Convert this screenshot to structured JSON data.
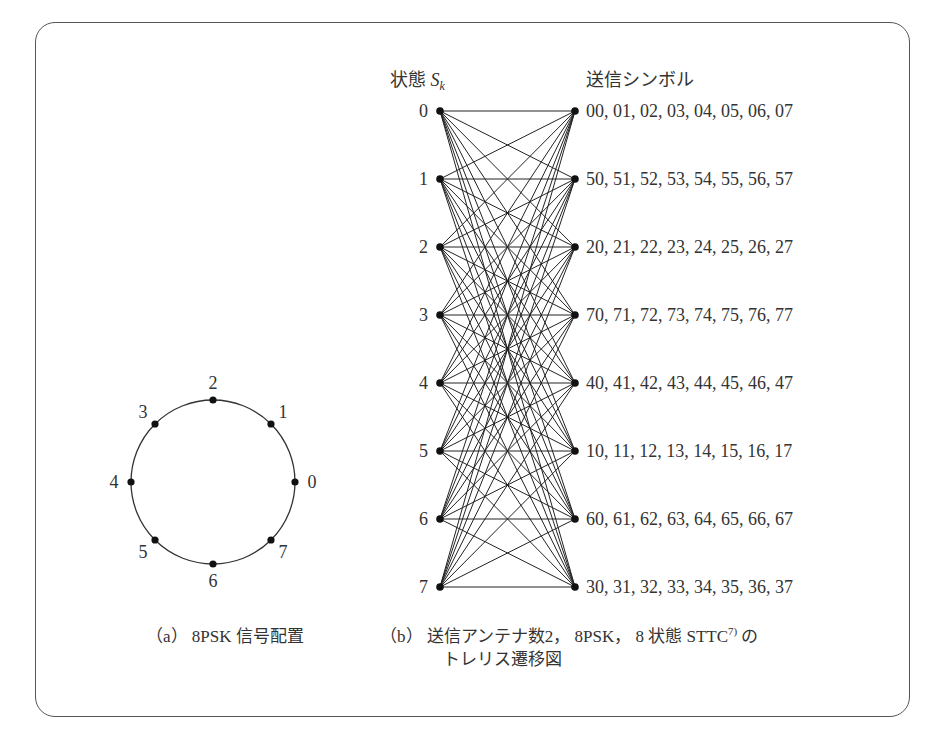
{
  "figure": {
    "panel_a": {
      "caption_prefix": "（a）",
      "caption": "8PSK 信号配置",
      "constellation_points": [
        {
          "label": "0",
          "angle_deg": 0
        },
        {
          "label": "1",
          "angle_deg": 45
        },
        {
          "label": "2",
          "angle_deg": 90
        },
        {
          "label": "3",
          "angle_deg": 135
        },
        {
          "label": "4",
          "angle_deg": 180
        },
        {
          "label": "5",
          "angle_deg": 225
        },
        {
          "label": "6",
          "angle_deg": 270
        },
        {
          "label": "7",
          "angle_deg": 315
        }
      ]
    },
    "panel_b": {
      "caption_prefix": "（b）",
      "caption_line1": "送信アンテナ数2， 8PSK， 8 状態 STTC",
      "caption_ref": "7)",
      "caption_suffix": " の",
      "caption_line2": "トレリス遷移図",
      "state_header": "状態 ",
      "state_symbol": "S",
      "state_subscript": "k",
      "symbol_header": "送信シンボル",
      "states": [
        "0",
        "1",
        "2",
        "3",
        "4",
        "5",
        "6",
        "7"
      ],
      "symbols": [
        "00, 01, 02, 03, 04, 05, 06, 07",
        "50, 51, 52, 53, 54, 55, 56, 57",
        "20, 21, 22, 23, 24, 25, 26, 27",
        "70, 71, 72, 73, 74, 75, 76, 77",
        "40, 41, 42, 43, 44, 45, 46, 47",
        "10, 11, 12, 13, 14, 15, 16, 17",
        "60, 61, 62, 63, 64, 65, 66, 67",
        "30, 31, 32, 33, 34, 35, 36, 37"
      ],
      "connectivity": "fully-connected"
    }
  }
}
